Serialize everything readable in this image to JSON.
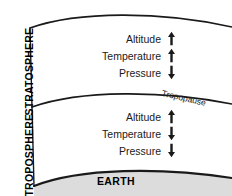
{
  "diagram": {
    "colors": {
      "line": "#1a1a1a",
      "earth_fill": "#dcdcdc",
      "text": "#1a1a1a",
      "background": "#ffffff"
    },
    "layers": {
      "stratosphere": {
        "name": "STRATOSPHERE",
        "variables": [
          {
            "label": "Altitude",
            "trend": "up",
            "glyph": "↑"
          },
          {
            "label": "Temperature",
            "trend": "up",
            "glyph": "↑"
          },
          {
            "label": "Pressure",
            "trend": "down",
            "glyph": "↓"
          }
        ]
      },
      "troposphere": {
        "name": "TROPOSPHERE",
        "variables": [
          {
            "label": "Altitude",
            "trend": "up",
            "glyph": "↑"
          },
          {
            "label": "Temperature",
            "trend": "down",
            "glyph": "↓"
          },
          {
            "label": "Pressure",
            "trend": "down",
            "glyph": "↓"
          }
        ]
      }
    },
    "boundaries": {
      "tropopause": "Tropopause"
    },
    "surface": {
      "name": "EARTH"
    }
  }
}
